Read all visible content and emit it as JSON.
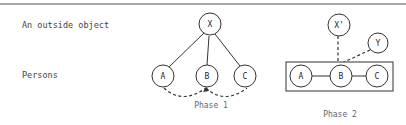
{
  "rows": {
    "outside_object_label": "An outside object",
    "persons_label": "Persons"
  },
  "phase1": {
    "caption": "Phase 1",
    "nodes": {
      "x": "X",
      "a": "A",
      "b": "B",
      "c": "C"
    }
  },
  "phase2": {
    "caption": "Phase 2",
    "nodes": {
      "x_prime": "X'",
      "y": "Y",
      "a": "A",
      "b": "B",
      "c": "C"
    }
  },
  "colors": {
    "line": "#333333",
    "rule": "#888888",
    "text": "#444444"
  }
}
